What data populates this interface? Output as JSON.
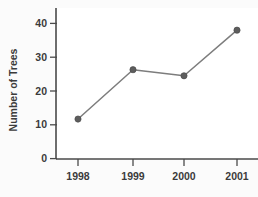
{
  "chart_data": {
    "type": "line",
    "title": "",
    "subtitle": "",
    "xlabel": "",
    "ylabel": "Number of Trees",
    "categories": [
      "1998",
      "1999",
      "2000",
      "2001"
    ],
    "x": [
      1998,
      1999,
      2000,
      2001
    ],
    "values": [
      11.7,
      26.3,
      24.5,
      38.0
    ],
    "series": [
      {
        "name": "Number of Trees",
        "values": [
          11.7,
          26.3,
          24.5,
          38.0
        ]
      }
    ],
    "ylim": [
      0,
      44
    ],
    "yticks": [
      0,
      10,
      20,
      30,
      40
    ],
    "ytick_labels": [
      "0",
      "10",
      "20",
      "30",
      "40"
    ],
    "xtick_labels": [
      "1998",
      "1999",
      "2000",
      "2001"
    ],
    "grid": false,
    "legend": false,
    "legend_position": "none",
    "colors": {
      "line": "#7d7d7d",
      "marker": "#5d5d5d",
      "axis": "#4a4a4a",
      "text": "#3b3b3b",
      "plot_background": "#ffffff",
      "figure_background": "#fbfbfb"
    },
    "marker_style": "circle",
    "annotations": []
  },
  "axes": {
    "y_title": "Number of Trees",
    "y_ticks": [
      {
        "label": "40",
        "value": 40
      },
      {
        "label": "30",
        "value": 30
      },
      {
        "label": "20",
        "value": 20
      },
      {
        "label": "10",
        "value": 10
      },
      {
        "label": "0",
        "value": 0
      }
    ],
    "x_ticks": [
      {
        "label": "1998",
        "value": 1998
      },
      {
        "label": "1999",
        "value": 1999
      },
      {
        "label": "2000",
        "value": 2000
      },
      {
        "label": "2001",
        "value": 2001
      }
    ]
  },
  "points": [
    {
      "x_label": "1998",
      "value": "11.7",
      "px": 78,
      "py": 119.5
    },
    {
      "x_label": "1999",
      "value": "26.3",
      "px": 133,
      "py": 70.1
    },
    {
      "x_label": "2000",
      "value": "24.5",
      "px": 184,
      "py": 76.2
    },
    {
      "x_label": "2001",
      "value": "38.0",
      "px": 237,
      "py": 30.3
    }
  ]
}
